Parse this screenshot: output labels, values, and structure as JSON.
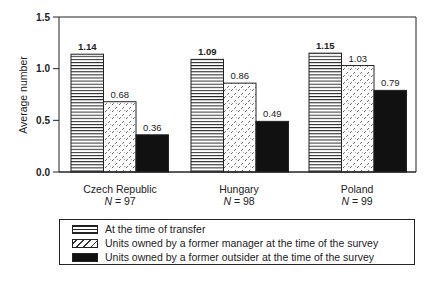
{
  "chart_data": {
    "type": "bar",
    "title": "",
    "xlabel": "",
    "ylabel": "Average number",
    "ylim": [
      0,
      1.5
    ],
    "yticks": [
      "0.0",
      "0.5",
      "1.0",
      "1.5"
    ],
    "grid": false,
    "legend_position": "bottom",
    "categories": [
      "Czech Republic",
      "Hungary",
      "Poland"
    ],
    "category_n": [
      "N = 97",
      "N = 98",
      "N = 99"
    ],
    "series": [
      {
        "name": "At the time of transfer",
        "pattern": "horizontal-lines",
        "values": [
          1.14,
          1.09,
          1.15
        ]
      },
      {
        "name": "Units owned by a former manager at the time of the survey",
        "pattern": "diagonal-hatch",
        "values": [
          0.68,
          0.86,
          1.03
        ]
      },
      {
        "name": "Units owned by a former outsider at the time of the survey",
        "pattern": "solid-black",
        "values": [
          0.36,
          0.49,
          0.79
        ]
      }
    ],
    "data_labels": [
      [
        "1.14",
        "0.68",
        "0.36"
      ],
      [
        "1.09",
        "0.86",
        "0.49"
      ],
      [
        "1.15",
        "1.03",
        "0.79"
      ]
    ]
  },
  "axis": {
    "ylabel": "Average number",
    "ticks": [
      "0.0",
      "0.5",
      "1.0",
      "1.5"
    ]
  },
  "categories": [
    {
      "label": "Czech Republic",
      "n_prefix": "N",
      "n_value": " = 97"
    },
    {
      "label": "Hungary",
      "n_prefix": "N",
      "n_value": " = 98"
    },
    {
      "label": "Poland",
      "n_prefix": "N",
      "n_value": " = 99"
    }
  ],
  "legend": {
    "items": [
      {
        "label": "At the time of transfer"
      },
      {
        "label": "Units owned by a former manager at the time of the survey"
      },
      {
        "label": "Units owned by a former outsider at the time of the survey"
      }
    ]
  },
  "colors": {
    "ink": "#1a1a1a",
    "solid": "#111111",
    "background": "#ffffff"
  }
}
